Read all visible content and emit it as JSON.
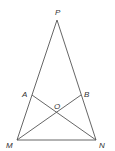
{
  "diagram": {
    "type": "geometry",
    "colors": {
      "line": "#555555",
      "label": "#333333",
      "background": "#ffffff"
    },
    "points": {
      "P": {
        "label": "P",
        "x": 57,
        "y": 20
      },
      "M": {
        "label": "M",
        "x": 17,
        "y": 140
      },
      "N": {
        "label": "N",
        "x": 96,
        "y": 140
      },
      "A": {
        "label": "A",
        "x": 32,
        "y": 95
      },
      "B": {
        "label": "B",
        "x": 81,
        "y": 95
      },
      "O": {
        "label": "O",
        "x": 57,
        "y": 112
      }
    },
    "segments": [
      "PM",
      "PN",
      "MN",
      "AN",
      "BM"
    ]
  }
}
